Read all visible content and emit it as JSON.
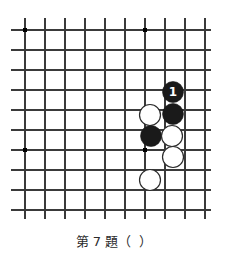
{
  "diagram": {
    "kind": "go-problem-diagram",
    "caption": "第 7 題（  ）",
    "caption_problem_number": "7",
    "board": {
      "line_color": "#3a3a3a",
      "border_color": "#1a1a1a",
      "background_color": "#ffffff",
      "origin_x": 25,
      "origin_y": 30,
      "spacing": 20,
      "cols": 10,
      "rows": 10,
      "edge_right_x": 211,
      "edge_bottom_y": 219,
      "line_overhang_left": 14,
      "line_overhang_top": 12
    },
    "star_points": [
      {
        "name": "hoshi-top-left",
        "col": 0,
        "row": 0
      },
      {
        "name": "hoshi-top-right",
        "col": 6,
        "row": 0
      },
      {
        "name": "hoshi-bottom-left",
        "col": 0,
        "row": 6
      },
      {
        "name": "hoshi-bottom-right",
        "col": 6,
        "row": 6
      }
    ],
    "stone_radius": 10.5,
    "stones": [
      {
        "id": "black-move-1",
        "color": "black",
        "col": 7.4,
        "row": 3.1,
        "label": "1",
        "label_color": "#ffffff"
      },
      {
        "id": "black-b2",
        "color": "black",
        "col": 7.4,
        "row": 4.2,
        "label": ""
      },
      {
        "id": "white-w1",
        "color": "white",
        "col": 6.25,
        "row": 4.25,
        "label": ""
      },
      {
        "id": "black-b3",
        "color": "black",
        "col": 6.3,
        "row": 5.3,
        "label": ""
      },
      {
        "id": "white-w2",
        "color": "white",
        "col": 7.35,
        "row": 5.3,
        "label": ""
      },
      {
        "id": "white-w3",
        "color": "white",
        "col": 7.4,
        "row": 6.35,
        "label": ""
      },
      {
        "id": "white-w4",
        "color": "white",
        "col": 6.25,
        "row": 7.5,
        "label": ""
      }
    ],
    "colors": {
      "black_stone": "#1a1a1a",
      "white_stone_fill": "#ffffff",
      "white_stone_stroke": "#2b2b2b",
      "grid": "#3a3a3a",
      "caption_text": "#2b2b2b"
    }
  }
}
